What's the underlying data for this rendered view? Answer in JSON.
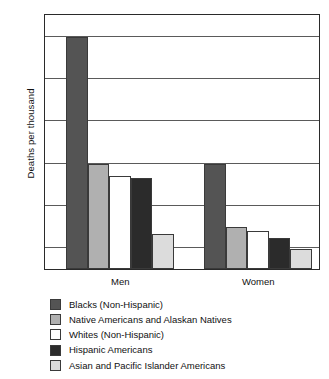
{
  "chart_data": {
    "type": "bar",
    "title": "",
    "xlabel": "",
    "ylabel": "Deaths per thousand",
    "categories": [
      "Men",
      "Women"
    ],
    "ylim": [
      1,
      13
    ],
    "yticks": [
      2,
      4,
      6,
      8,
      10,
      12
    ],
    "ytick_labels": [
      "2",
      "4",
      "6",
      "8",
      "10",
      "12"
    ],
    "grid": true,
    "legend_position": "below",
    "series": [
      {
        "name": "Blacks (Non-Hispanic)",
        "color": "#545454",
        "values": [
          12.0,
          6.0
        ]
      },
      {
        "name": "Native Americans and Alaskan Natives",
        "color": "#b0b0b0",
        "values": [
          6.0,
          3.0
        ]
      },
      {
        "name": "Whites (Non-Hispanic)",
        "color": "#ffffff",
        "values": [
          5.4,
          2.8
        ]
      },
      {
        "name": "Hispanic Americans",
        "color": "#2b2b2b",
        "values": [
          5.3,
          2.45
        ]
      },
      {
        "name": "Asian and Pacific Islander Americans",
        "color": "#dcdcdc",
        "values": [
          2.65,
          1.95
        ]
      }
    ]
  },
  "axis": {
    "y_title": "Deaths per thousand",
    "y_tick_labels": [
      "12",
      "10",
      "8",
      "6",
      "4",
      "2"
    ],
    "x_tick_labels": [
      "Men",
      "Women"
    ]
  },
  "legend": {
    "items": [
      {
        "label": "Blacks (Non-Hispanic)",
        "color": "#545454"
      },
      {
        "label": "Native Americans and Alaskan Natives",
        "color": "#b0b0b0"
      },
      {
        "label": "Whites (Non-Hispanic)",
        "color": "#ffffff"
      },
      {
        "label": "Hispanic Americans",
        "color": "#2b2b2b"
      },
      {
        "label": "Asian and Pacific Islander Americans",
        "color": "#dcdcdc"
      }
    ]
  }
}
